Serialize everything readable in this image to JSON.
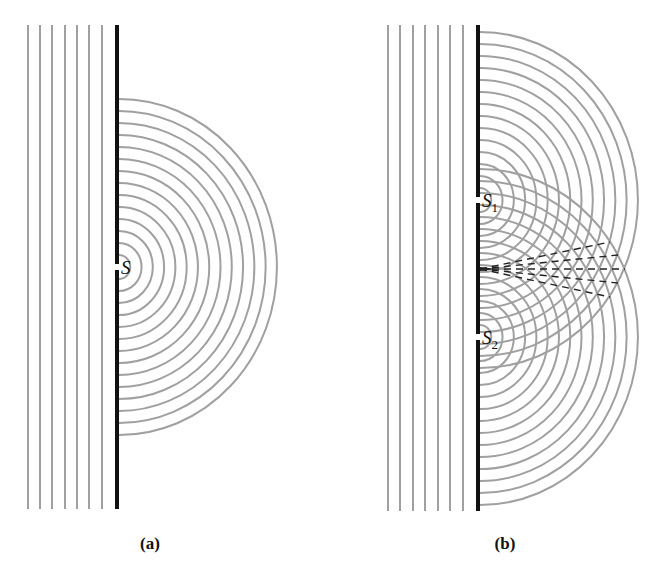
{
  "figure": {
    "width": 647,
    "height": 576,
    "colors": {
      "wave": "#a0a0a0",
      "barrier": "#111111",
      "dash": "#222222",
      "text": "#111111"
    }
  },
  "panels": [
    {
      "id": "a",
      "caption": "(a)",
      "caption_x": 150,
      "caption_y": 549,
      "plane_waves_x": [
        28,
        40,
        52,
        65,
        77,
        89,
        102
      ],
      "lines_top": 25,
      "lines_bottom": 509,
      "barrier_x": 117,
      "barrier_top": 25,
      "barrier_bottom": 509,
      "slits": [
        {
          "label": "S",
          "sub": "",
          "y": 267
        }
      ],
      "arc_count": 14,
      "arc_spacing": 12,
      "arc_xscale": 0.94,
      "dashed_rays": []
    },
    {
      "id": "b",
      "caption": "(b)",
      "caption_x": 505,
      "caption_y": 549,
      "plane_waves_x": [
        388,
        400,
        413,
        425,
        438,
        450,
        463
      ],
      "lines_top": 25,
      "lines_bottom": 511,
      "barrier_x": 478,
      "barrier_top": 25,
      "barrier_bottom": 511,
      "slits": [
        {
          "label": "S",
          "sub": "1",
          "y": 200
        },
        {
          "label": "S",
          "sub": "2",
          "y": 337
        }
      ],
      "arc_count": 14,
      "arc_spacing": 12,
      "arc_xscale": 0.94,
      "dashed_rays": {
        "origin": [
          480,
          269
        ],
        "ends": [
          [
            610,
            242
          ],
          [
            618,
            255
          ],
          [
            625,
            269
          ],
          [
            618,
            283
          ],
          [
            610,
            297
          ]
        ]
      }
    }
  ]
}
